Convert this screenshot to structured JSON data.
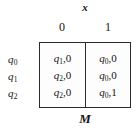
{
  "figure": {
    "machine_label": "M",
    "input_variable_label": "x",
    "column_headers": [
      "0",
      "1"
    ],
    "row_headers": [
      {
        "state": "q",
        "index": "0"
      },
      {
        "state": "q",
        "index": "1"
      },
      {
        "state": "q",
        "index": "2"
      }
    ],
    "cells": [
      [
        {
          "next_state": "q",
          "next_state_index": "1",
          "separator": ",",
          "output": "0"
        },
        {
          "next_state": "q",
          "next_state_index": "0",
          "separator": ",",
          "output": "0"
        }
      ],
      [
        {
          "next_state": "q",
          "next_state_index": "2",
          "separator": ",",
          "output": "0"
        },
        {
          "next_state": "q",
          "next_state_index": "0",
          "separator": ",",
          "output": "0"
        }
      ],
      [
        {
          "next_state": "q",
          "next_state_index": "2",
          "separator": ",",
          "output": "0"
        },
        {
          "next_state": "q",
          "next_state_index": "0",
          "separator": ",",
          "output": "1"
        }
      ]
    ],
    "colors": {
      "background": "#ffffff",
      "table_fill": "#fdfdfd",
      "border": "#2b2b2b",
      "text": "#141414"
    }
  }
}
